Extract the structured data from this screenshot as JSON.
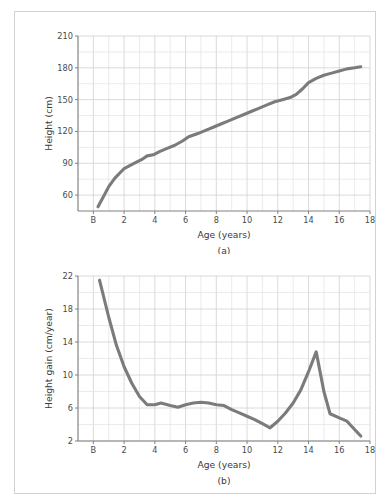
{
  "figure": {
    "caption_a": "(a)",
    "caption_b": "(b)",
    "line_color": "#7b7b7b",
    "grid_color": "#e2e2e2",
    "axis_color": "#808080",
    "background": "#ffffff",
    "border_color": "#d2d2d2"
  },
  "chart_data": [
    {
      "type": "line",
      "panel": "a",
      "title": "",
      "xlabel": "Age (years)",
      "ylabel": "Height (cm)",
      "xlim": [
        -1,
        18
      ],
      "ylim": [
        45,
        210
      ],
      "xticks": [
        0,
        2,
        4,
        6,
        8,
        10,
        12,
        14,
        16,
        18
      ],
      "xticklabels": [
        "B",
        "2",
        "4",
        "6",
        "8",
        "10",
        "12",
        "14",
        "16",
        "18"
      ],
      "yticks": [
        60,
        90,
        120,
        150,
        180,
        210
      ],
      "yticklabels": [
        "60",
        "90",
        "120",
        "150",
        "180",
        "210"
      ],
      "grid": true,
      "legend": "none",
      "x": [
        0.3,
        0.6,
        1.0,
        1.4,
        1.8,
        2.0,
        2.4,
        2.8,
        3.2,
        3.5,
        3.9,
        4.3,
        4.8,
        5.3,
        5.8,
        6.2,
        6.8,
        7.3,
        7.8,
        8.3,
        8.8,
        9.3,
        9.8,
        10.3,
        10.8,
        11.3,
        11.8,
        12.3,
        12.8,
        13.2,
        13.6,
        14.0,
        14.5,
        15.0,
        15.5,
        16.0,
        16.5,
        17.0,
        17.4
      ],
      "y": [
        49,
        57,
        68,
        76,
        82,
        85,
        88,
        91,
        94,
        97,
        98,
        101,
        104,
        107,
        111,
        115,
        118,
        121,
        124,
        127,
        130,
        133,
        136,
        139,
        142,
        145,
        148,
        150,
        152,
        155,
        160,
        166,
        170,
        173,
        175,
        177,
        179,
        180,
        181
      ]
    },
    {
      "type": "line",
      "panel": "b",
      "title": "",
      "xlabel": "Age (years)",
      "ylabel": "Height gain (cm/year)",
      "xlim": [
        -1,
        18
      ],
      "ylim": [
        2,
        22
      ],
      "xticks": [
        0,
        2,
        4,
        6,
        8,
        10,
        12,
        14,
        16,
        18
      ],
      "xticklabels": [
        "B",
        "2",
        "4",
        "6",
        "8",
        "10",
        "12",
        "14",
        "16",
        "18"
      ],
      "yticks": [
        2,
        6,
        10,
        14,
        18,
        22
      ],
      "yticklabels": [
        "2",
        "6",
        "10",
        "14",
        "18",
        "22"
      ],
      "grid": true,
      "legend": "none",
      "x": [
        0.4,
        1.0,
        1.5,
        2.0,
        2.5,
        3.0,
        3.5,
        4.0,
        4.4,
        5.0,
        5.5,
        6.0,
        6.5,
        7.0,
        7.5,
        8.0,
        8.5,
        9.0,
        9.5,
        10.0,
        10.5,
        11.0,
        11.5,
        12.0,
        12.5,
        13.0,
        13.5,
        14.0,
        14.5,
        15.0,
        15.4,
        16.0,
        16.5,
        17.0,
        17.4
      ],
      "y": [
        21.5,
        17.0,
        13.6,
        11.0,
        9.0,
        7.4,
        6.4,
        6.4,
        6.6,
        6.3,
        6.1,
        6.4,
        6.6,
        6.7,
        6.6,
        6.4,
        6.3,
        5.8,
        5.4,
        5.0,
        4.6,
        4.1,
        3.6,
        4.4,
        5.4,
        6.6,
        8.2,
        10.4,
        12.8,
        8.0,
        5.3,
        4.8,
        4.4,
        3.4,
        2.6
      ]
    }
  ]
}
